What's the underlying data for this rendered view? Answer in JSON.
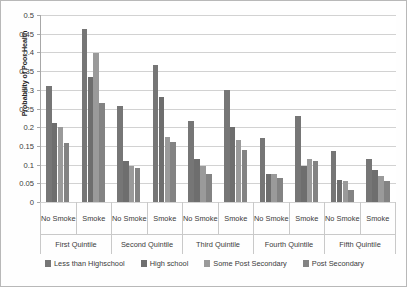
{
  "chart_data": {
    "type": "bar",
    "title": "",
    "xlabel": "",
    "ylabel": "Probability of Poor Health",
    "ylim": [
      0,
      0.5
    ],
    "ytick_labels": [
      "0",
      "0.05",
      "0.1",
      "0.15",
      "0.2",
      "0.25",
      "0.3",
      "0.35",
      "0.4",
      "0.45",
      "0.5"
    ],
    "ytick_values": [
      0,
      0.05,
      0.1,
      0.15,
      0.2,
      0.25,
      0.3,
      0.35,
      0.4,
      0.45,
      0.5
    ],
    "grid": true,
    "legend_position": "bottom",
    "group_labels": [
      "First Quintile",
      "Second Quintile",
      "Third Quintile",
      "Fourth Quintile",
      "Fifth Quintile"
    ],
    "subgroup_labels": [
      "No Smoke",
      "Smoke"
    ],
    "categories": [
      "First Quintile / No Smoke",
      "First Quintile / Smoke",
      "Second Quintile / No Smoke",
      "Second Quintile / Smoke",
      "Third Quintile / No Smoke",
      "Third Quintile / Smoke",
      "Fourth Quintile / No Smoke",
      "Fourth Quintile / Smoke",
      "Fifth Quintile / No Smoke",
      "Fifth Quintile / Smoke"
    ],
    "series": [
      {
        "name": "Less than Highschool",
        "color": "#767676",
        "values": [
          0.31,
          0.462,
          0.257,
          0.366,
          0.217,
          0.3,
          0.17,
          0.23,
          0.137,
          0.115
        ]
      },
      {
        "name": "High school",
        "color": "#6e6e6e",
        "values": [
          0.212,
          0.335,
          0.11,
          0.281,
          0.115,
          0.2,
          0.075,
          0.095,
          0.06,
          0.085
        ]
      },
      {
        "name": "Some Post Secondary",
        "color": "#9a9a9a",
        "values": [
          0.2,
          0.399,
          0.095,
          0.175,
          0.095,
          0.167,
          0.075,
          0.115,
          0.055,
          0.07
        ]
      },
      {
        "name": "Post Secondary",
        "color": "#838383",
        "values": [
          0.157,
          0.264,
          0.09,
          0.16,
          0.075,
          0.14,
          0.065,
          0.11,
          0.033,
          0.055
        ]
      }
    ]
  },
  "colors": {
    "gridline": "#d2d2d2",
    "axis": "#a8a8a8",
    "frame_border": "#b8b8b8",
    "text": "#3a3a3a",
    "plot_background": "#ffffff"
  }
}
